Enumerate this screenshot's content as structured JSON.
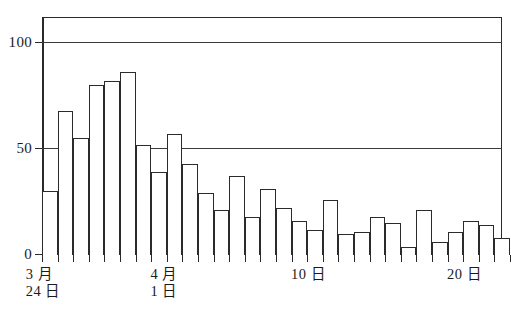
{
  "chart_data": {
    "type": "bar",
    "title": "",
    "subtitle": "",
    "xlabel": "",
    "ylabel": "",
    "ylim": [
      0,
      112
    ],
    "xlim": [
      0,
      29
    ],
    "grid": "horizontal gridlines at 50 and 100",
    "legend": "none",
    "legend_position": "none",
    "y_ticks": [
      0,
      50,
      100
    ],
    "y_tick_labels": [
      "0",
      "50",
      "100"
    ],
    "x_tick_labels": [
      "3月\n24日",
      "4月\n1日",
      "10日",
      "20日"
    ],
    "x_tick_positions": [
      0,
      8,
      17,
      27
    ],
    "categories": [
      "3月24日",
      "3月25日",
      "3月26日",
      "3月27日",
      "3月28日",
      "3月29日",
      "3月30日",
      "3月31日",
      "4月1日",
      "4月2日",
      "4月3日",
      "4月4日",
      "4月5日",
      "4月6日",
      "4月7日",
      "4月8日",
      "4月9日",
      "4月10日",
      "4月11日",
      "4月12日",
      "4月13日",
      "4月14日",
      "4月15日",
      "4月16日",
      "4月17日",
      "4月18日",
      "4月19日",
      "4月20日",
      "4月21日",
      "4月22日"
    ],
    "values": [
      30,
      68,
      55,
      80,
      82,
      86,
      52,
      39,
      57,
      43,
      29,
      21,
      37,
      18,
      31,
      22,
      16,
      12,
      26,
      10,
      11,
      18,
      15,
      4,
      21,
      6,
      11,
      16,
      14,
      8
    ],
    "bar_color": "#ffffff",
    "bar_edge_color": "#2b2b2b",
    "axis_color": "#2a2a2a"
  },
  "axis": {
    "y_labels": [
      {
        "text": "100",
        "value": 100
      },
      {
        "text": "50",
        "value": 50
      },
      {
        "text": "0",
        "value": 0
      }
    ],
    "x_labels": [
      {
        "line1": "3 月",
        "line2": "24 日",
        "index": 0
      },
      {
        "line1": "4 月",
        "line2": "1 日",
        "index": 8
      },
      {
        "line1": "10 日",
        "line2": "",
        "index": 17
      },
      {
        "line1": "20 日",
        "line2": "",
        "index": 27
      }
    ]
  }
}
